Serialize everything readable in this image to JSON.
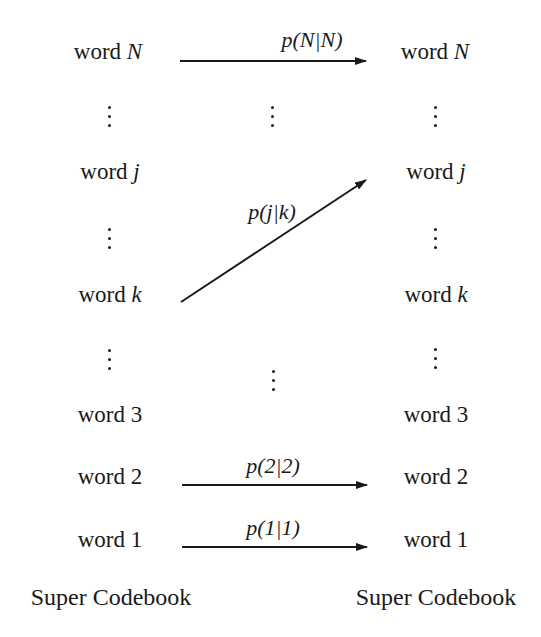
{
  "diagram": {
    "left_column": {
      "title": "Super Codebook",
      "words": [
        {
          "prefix": "word ",
          "index": "N",
          "italic": true
        },
        {
          "prefix": "word ",
          "index": "j",
          "italic": true
        },
        {
          "prefix": "word ",
          "index": "k",
          "italic": true
        },
        {
          "prefix": "word ",
          "index": "3",
          "italic": false
        },
        {
          "prefix": "word ",
          "index": "2",
          "italic": false
        },
        {
          "prefix": "word ",
          "index": "1",
          "italic": false
        }
      ]
    },
    "right_column": {
      "title": "Super Codebook",
      "words": [
        {
          "prefix": "word ",
          "index": "N",
          "italic": true
        },
        {
          "prefix": "word ",
          "index": "j",
          "italic": true
        },
        {
          "prefix": "word ",
          "index": "k",
          "italic": true
        },
        {
          "prefix": "word ",
          "index": "3",
          "italic": false
        },
        {
          "prefix": "word ",
          "index": "2",
          "italic": false
        },
        {
          "prefix": "word ",
          "index": "1",
          "italic": false
        }
      ]
    },
    "transitions": [
      {
        "from": "word N",
        "to": "word N",
        "label": "p(N|N)"
      },
      {
        "from": "word k",
        "to": "word j",
        "label": "p(j|k)"
      },
      {
        "from": "word 2",
        "to": "word 2",
        "label": "p(2|2)"
      },
      {
        "from": "word 1",
        "to": "word 1",
        "label": "p(1|1)"
      }
    ],
    "ellipsis": "⋮"
  }
}
